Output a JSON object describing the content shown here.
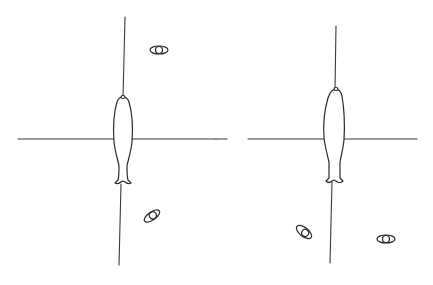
{
  "figure": {
    "panels": [
      {
        "id": "left",
        "axes": {
          "horizontal": {
            "x1": 18,
            "y1": 139,
            "x2": 216,
            "y2": 139
          },
          "vertical": {
            "x1": 125,
            "y1": 17,
            "x2": 119,
            "y2": 265
          }
        },
        "fish": {
          "cx": 123,
          "top": 97,
          "tail": 185
        },
        "eye_symbols": [
          {
            "cx": 159,
            "cy": 50,
            "rotate": 0
          },
          {
            "cx": 152,
            "cy": 216,
            "rotate": -35
          }
        ]
      },
      {
        "id": "right",
        "axes": {
          "horizontal": {
            "x1": 248,
            "y1": 139,
            "x2": 417,
            "y2": 139
          },
          "horizontal_stub": {
            "x1": 216,
            "y1": 139,
            "x2": 227,
            "y2": 139
          },
          "vertical": {
            "x1": 336,
            "y1": 26,
            "x2": 330,
            "y2": 263
          }
        },
        "fish": {
          "cx": 335,
          "top": 89,
          "tail": 183
        },
        "eye_symbols": [
          {
            "cx": 304,
            "cy": 232,
            "rotate": 35
          },
          {
            "cx": 386,
            "cy": 239,
            "rotate": 0
          }
        ]
      }
    ],
    "colors": {
      "line": "#3a3a3a",
      "background": "#ffffff"
    }
  }
}
